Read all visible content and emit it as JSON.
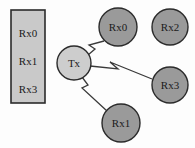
{
  "diagram": {
    "background_color": "#fdfdfd",
    "queue": {
      "name": "transmit-queue",
      "x": 11,
      "y": 10,
      "width": 34,
      "height": 93,
      "fill": "#c9c9c9",
      "stroke": "#2b2b2b",
      "stroke_width": 1.6,
      "items": [
        {
          "label": "Rx0",
          "cx": 28,
          "cy": 34
        },
        {
          "label": "Rx1",
          "cx": 28,
          "cy": 62
        },
        {
          "label": "Rx3",
          "cx": 28,
          "cy": 90
        }
      ]
    },
    "nodes": [
      {
        "name": "tx-node",
        "label": "Tx",
        "cx": 74,
        "cy": 63,
        "r": 17,
        "fill": "#cdcdcd",
        "stroke": "#2b2b2b",
        "stroke_width": 1.4
      },
      {
        "name": "rx0-node",
        "label": "Rx0",
        "cx": 118,
        "cy": 27,
        "r": 19,
        "fill": "#9a9a9a",
        "stroke": "#2b2b2b",
        "stroke_width": 1.4
      },
      {
        "name": "rx2-node",
        "label": "Rx2",
        "cx": 170,
        "cy": 27,
        "r": 18,
        "fill": "#9a9a9a",
        "stroke": "#2b2b2b",
        "stroke_width": 1.4
      },
      {
        "name": "rx3-node",
        "label": "Rx3",
        "cx": 170,
        "cy": 85,
        "r": 18,
        "fill": "#9a9a9a",
        "stroke": "#2b2b2b",
        "stroke_width": 1.4
      },
      {
        "name": "rx1-node",
        "label": "Rx1",
        "cx": 121,
        "cy": 123,
        "r": 19,
        "fill": "#9a9a9a",
        "stroke": "#2b2b2b",
        "stroke_width": 1.4
      }
    ],
    "links": [
      {
        "name": "link-tx-to-rx0",
        "from": "tx-node",
        "to": "rx0-node",
        "style": "lightning-arrow",
        "stroke": "#3a3a3a",
        "stroke_width": 1.3,
        "points": "88,55 95,49 89,45 104,41"
      },
      {
        "name": "link-tx-to-rx3",
        "from": "tx-node",
        "to": "rx3-node",
        "style": "lightning-arrow",
        "stroke": "#3a3a3a",
        "stroke_width": 1.3,
        "points": "90,66 118,69 110,62 152,79"
      },
      {
        "name": "link-tx-to-rx1",
        "from": "tx-node",
        "to": "rx1-node",
        "style": "lightning-arrow",
        "stroke": "#3a3a3a",
        "stroke_width": 1.3,
        "points": "82,77 88,85 82,88 107,111"
      }
    ]
  }
}
